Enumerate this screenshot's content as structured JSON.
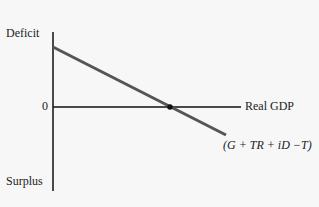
{
  "diagram": {
    "y_axis_top_label": "Deficit",
    "y_axis_bottom_label": "Surplus",
    "zero_label": "0",
    "x_axis_label": "Real GDP",
    "line_label": "(G + TR + iD −T)",
    "colors": {
      "background": "#f7f7f7",
      "axis": "#111111",
      "budget_line": "#555555",
      "point": "#111111"
    }
  }
}
